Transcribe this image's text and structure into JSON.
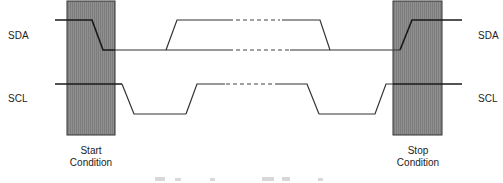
{
  "diagram": {
    "signals": {
      "sda_left": "SDA",
      "scl_left": "SCL",
      "sda_right": "SDA",
      "scl_right": "SCL"
    },
    "conditions": {
      "start": {
        "line1": "Start",
        "line2": "Condition"
      },
      "stop": {
        "line1": "Stop",
        "line2": "Condition"
      }
    },
    "colors": {
      "box_fill": "#8a8a8a",
      "line": "#333333",
      "background": "#ffffff"
    }
  }
}
